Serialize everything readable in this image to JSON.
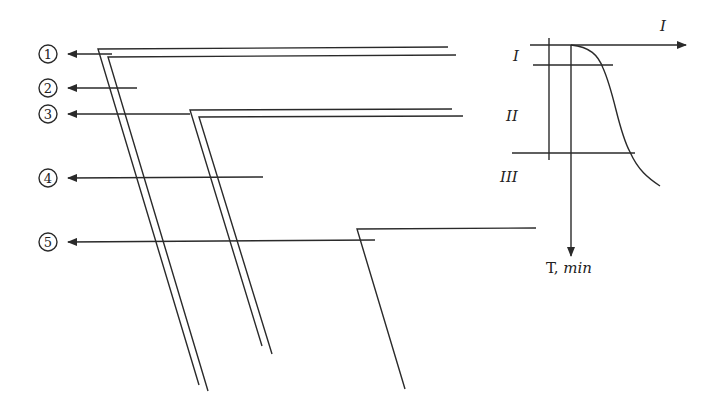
{
  "diagram": {
    "layers": [
      {
        "id": 1,
        "label": "①",
        "y": 53
      },
      {
        "id": 2,
        "label": "②",
        "y": 87
      },
      {
        "id": 3,
        "label": "③",
        "y": 114
      },
      {
        "id": 4,
        "label": "④",
        "y": 178
      },
      {
        "id": 5,
        "label": "⑤",
        "y": 241
      }
    ],
    "graph": {
      "x_axis_label": "I",
      "y_axis_label_main": "T, ",
      "y_axis_label_unit": "min",
      "zones": [
        "I",
        "II",
        "III"
      ]
    }
  }
}
